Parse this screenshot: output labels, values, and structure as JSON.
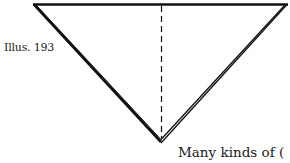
{
  "figure": {
    "caption": "Illus. 193",
    "stroke_color": "#111111",
    "background": "#ffffff"
  },
  "text": {
    "body_fragment": "Many kinds of ("
  }
}
